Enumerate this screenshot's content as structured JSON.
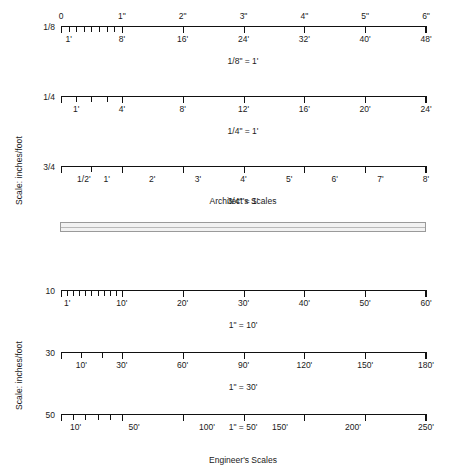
{
  "figure": {
    "axis_caption_architect": "Scale: inches/foot",
    "axis_caption_engineer": "Scale: inches/foot",
    "group_caption_architect": "Architect's Scales",
    "group_caption_engineer": "Engineer's Scales"
  },
  "chart_data": {
    "type": "table",
    "xlabel": "",
    "ylabel": "Scale: inches/foot",
    "grid": false,
    "legend": "none",
    "groups": [
      {
        "name": "Architect's Scales",
        "caption": "Architect's Scales",
        "axis_label": "Scale: inches/foot",
        "scales": [
          {
            "key": "1/8",
            "caption": "1/8\" = 1'",
            "inch_length": 6,
            "feet_per_inch": 8,
            "subdivisions_first_inch": 8,
            "top_labels": [
              "0",
              "1\"",
              "2\"",
              "3\"",
              "4\"",
              "5\"",
              "6\""
            ],
            "top_values": [
              0,
              1,
              2,
              3,
              4,
              5,
              6
            ],
            "bottom_labels": [
              "1'",
              "8'",
              "16'",
              "24'",
              "32'",
              "40'",
              "48'"
            ],
            "bottom_values": [
              1,
              8,
              16,
              24,
              32,
              40,
              48
            ],
            "max_feet": 48
          },
          {
            "key": "1/4",
            "caption": "1/4\" = 1'",
            "inch_length": 6,
            "feet_per_inch": 4,
            "subdivisions_first_inch": 4,
            "top_labels": [],
            "top_values": [],
            "bottom_labels": [
              "1'",
              "4'",
              "8'",
              "12'",
              "16'",
              "20'",
              "24'"
            ],
            "bottom_values": [
              1,
              4,
              8,
              12,
              16,
              20,
              24
            ],
            "max_feet": 24
          },
          {
            "key": "3/4",
            "caption": "3/4\" = 1'",
            "inch_length": 6,
            "feet_per_inch": 1.3333,
            "subdivisions_first_inch": 2,
            "top_labels": [],
            "top_values": [],
            "bottom_labels": [
              "1/2'",
              "1'",
              "2'",
              "3'",
              "4'",
              "5'",
              "6'",
              "7'",
              "8'"
            ],
            "bottom_values": [
              0.5,
              1,
              2,
              3,
              4,
              5,
              6,
              7,
              8
            ],
            "max_feet": 8
          }
        ]
      },
      {
        "name": "Engineer's Scales",
        "caption": "Engineer's Scales",
        "axis_label": "Scale: inches/foot",
        "scales": [
          {
            "key": "10",
            "caption": "1\" = 10'",
            "inch_length": 6,
            "feet_per_inch": 10,
            "subdivisions_first_inch": 10,
            "top_labels": [],
            "top_values": [],
            "bottom_labels": [
              "1'",
              "10'",
              "20'",
              "30'",
              "40'",
              "50'",
              "60'"
            ],
            "bottom_values": [
              1,
              10,
              20,
              30,
              40,
              50,
              60
            ],
            "max_feet": 60
          },
          {
            "key": "30",
            "caption": "1\" = 30'",
            "inch_length": 6,
            "feet_per_inch": 30,
            "subdivisions_first_inch": 3,
            "top_labels": [],
            "top_values": [],
            "bottom_labels": [
              "10'",
              "30'",
              "60'",
              "90'",
              "120'",
              "150'",
              "180'"
            ],
            "bottom_values": [
              10,
              30,
              60,
              90,
              120,
              150,
              180
            ],
            "max_feet": 180
          },
          {
            "key": "50",
            "caption": "1\" = 50'",
            "inch_length": 6,
            "feet_per_inch": 50,
            "subdivisions_first_inch": 5,
            "top_labels": [],
            "top_values": [],
            "bottom_labels": [
              "10'",
              "50'",
              "100'",
              "150'",
              "200'",
              "250'"
            ],
            "bottom_values": [
              10,
              50,
              100,
              150,
              200,
              250
            ],
            "max_feet": 250
          }
        ]
      }
    ]
  }
}
